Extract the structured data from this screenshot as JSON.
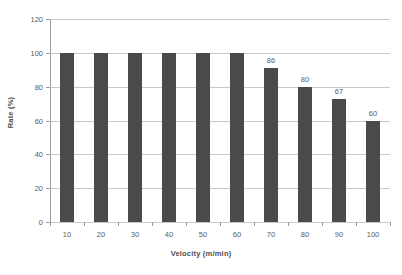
{
  "chart_data": {
    "type": "bar",
    "title": "",
    "xlabel": "Velocity (m/min)",
    "ylabel": "Rate (%)",
    "categories": [
      "10",
      "20",
      "30",
      "40",
      "50",
      "60",
      "70",
      "80",
      "90",
      "100"
    ],
    "values": [
      100,
      100,
      100,
      100,
      100,
      100,
      86,
      80,
      67,
      60
    ],
    "bar_display_heights": [
      100,
      100,
      100,
      100,
      100,
      100,
      91,
      80,
      73,
      60
    ],
    "point_labels": [
      "",
      "",
      "",
      "",
      "",
      "",
      "86",
      "80",
      "67",
      "60"
    ],
    "ylim": [
      0,
      120
    ],
    "yticks": [
      0,
      20,
      40,
      60,
      80,
      100,
      120
    ],
    "ytick_labels": [
      "0",
      "20",
      "40",
      "60",
      "80",
      "100",
      "120"
    ],
    "grid": true,
    "grid_axis": "y",
    "legend": false,
    "series": [
      {
        "name": "Rate",
        "values": [
          100,
          100,
          100,
          100,
          100,
          100,
          86,
          80,
          67,
          60
        ]
      }
    ],
    "colors": {
      "bar": "#4a4a4a",
      "gridline": "#c9c9c9",
      "axis": "#9a9a9a",
      "text": "#5c5c5c",
      "axis_title": "#4d4d4d",
      "background": "#ffffff"
    }
  }
}
